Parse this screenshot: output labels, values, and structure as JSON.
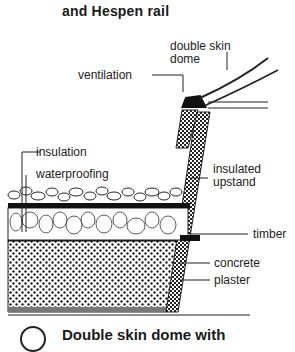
{
  "title": {
    "line_prev_fragment": "g",
    "line": "and Hespen rail"
  },
  "labels": {
    "double_skin_dome": [
      "double skin",
      "dome"
    ],
    "ventilation": "ventilation",
    "insulation": "insulation",
    "waterproofing": "waterproofing",
    "insulated_upstand": [
      "insulated",
      "upstand"
    ],
    "timber": "timber",
    "concrete": "concrete",
    "plaster": "plaster"
  },
  "caption": {
    "number_circle": "",
    "text": "Double skin dome with"
  },
  "colors": {
    "ink": "#1a1a1a",
    "background": "#ffffff"
  }
}
